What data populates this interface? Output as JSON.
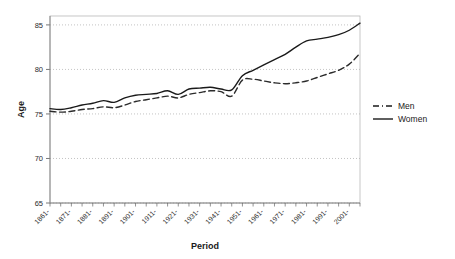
{
  "chart_data": {
    "type": "line",
    "title": "",
    "subtitle": "",
    "xlabel": "Period",
    "ylabel": "Age",
    "ylim": [
      65,
      86
    ],
    "xlim": [
      1861,
      2006
    ],
    "grid": true,
    "legend_position": "right",
    "yticks": [
      65,
      70,
      75,
      80,
      85
    ],
    "ytick_labels": [
      "65",
      "70",
      "75",
      "80",
      "85"
    ],
    "xtick_labels": [
      "1861-",
      "1871-",
      "1881-",
      "1891-",
      "1901-",
      "1911-",
      "1921-",
      "1931-",
      "1941-",
      "1951-",
      "1961-",
      "1971-",
      "1981-",
      "1991-",
      "2001-"
    ],
    "xtick_values": [
      1861,
      1871,
      1881,
      1891,
      1901,
      1911,
      1921,
      1931,
      1941,
      1951,
      1961,
      1971,
      1981,
      1991,
      2001
    ],
    "x": [
      1861,
      1866,
      1871,
      1876,
      1881,
      1886,
      1891,
      1896,
      1901,
      1906,
      1911,
      1916,
      1921,
      1926,
      1931,
      1936,
      1941,
      1946,
      1951,
      1956,
      1961,
      1966,
      1971,
      1976,
      1981,
      1986,
      1991,
      1996,
      2001,
      2006
    ],
    "series": [
      {
        "name": "Men",
        "style": "dashed",
        "color": "#2b2b2b",
        "values": [
          75.3,
          75.2,
          75.3,
          75.5,
          75.6,
          75.8,
          75.7,
          76.0,
          76.4,
          76.6,
          76.8,
          77.0,
          76.8,
          77.2,
          77.4,
          77.6,
          77.5,
          77.0,
          78.8,
          78.9,
          78.7,
          78.5,
          78.4,
          78.5,
          78.7,
          79.1,
          79.5,
          79.9,
          80.6,
          81.8
        ]
      },
      {
        "name": "Women",
        "style": "solid",
        "color": "#1a1a1a",
        "values": [
          75.6,
          75.5,
          75.7,
          76.0,
          76.2,
          76.5,
          76.3,
          76.8,
          77.1,
          77.2,
          77.3,
          77.6,
          77.2,
          77.8,
          77.9,
          78.0,
          77.8,
          77.7,
          79.3,
          79.9,
          80.5,
          81.1,
          81.7,
          82.5,
          83.2,
          83.4,
          83.6,
          83.9,
          84.4,
          85.2
        ]
      }
    ]
  },
  "legend": {
    "items": [
      {
        "label": "Men",
        "style": "dashed"
      },
      {
        "label": "Women",
        "style": "solid"
      }
    ]
  }
}
